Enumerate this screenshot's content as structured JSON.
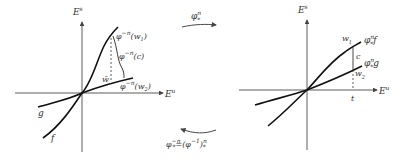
{
  "left_panel": {
    "axis_y_label": "E",
    "axis_y_sup": "s",
    "axis_x_label": "E",
    "axis_x_sup": "u",
    "label_w1": "φ",
    "label_w1_sup": "−n",
    "label_w1_arg": "(w",
    "label_w1_sub": "1",
    "label_w1_end": ")",
    "label_c": "φ",
    "label_c_sup": "−n",
    "label_c_arg": "(c)",
    "label_w2": "φ",
    "label_w2_sup": "−n",
    "label_w2_arg": "(w",
    "label_w2_sub": "2",
    "label_w2_end": ")",
    "label_wbar": "w̄",
    "curve_g": "g",
    "curve_f": "f"
  },
  "right_panel": {
    "axis_y_label": "E",
    "axis_y_sup": "s",
    "axis_x_label": "E",
    "axis_x_sup": "u",
    "label_w1": "w",
    "label_w1_sub": "1",
    "label_w2": "w",
    "label_w2_sub": "2",
    "label_c": "c",
    "label_t": "t",
    "curve_f": "φ",
    "curve_f_sup": "n",
    "curve_f_sub": "*",
    "curve_f_tail": "f",
    "curve_g": "φ",
    "curve_g_sup": "n",
    "curve_g_sub": "*",
    "curve_g_tail": "g"
  },
  "arrows": {
    "forward_label": "φ",
    "forward_sup": "n",
    "forward_sub": "*",
    "backward_label": "φ",
    "backward_sup": "−n",
    "backward_sub": "*",
    "backward_eq": "=(φ",
    "backward_eq_sup": "−1",
    "backward_eq_end": ")",
    "backward_eq_end_sup": "n",
    "backward_eq_end_sub": "*"
  }
}
